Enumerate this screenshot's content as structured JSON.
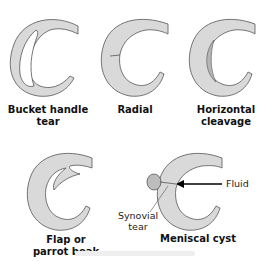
{
  "diagram": {
    "colors": {
      "fill": "#d9d9d9",
      "stroke": "#555555",
      "cyst": "#bdbdbd",
      "arrow": "#000000",
      "text": "#111111"
    },
    "panels": [
      {
        "id": "bucket-handle",
        "label_line1": "Bucket handle",
        "label_line2": "tear"
      },
      {
        "id": "radial",
        "label_line1": "Radial",
        "label_line2": ""
      },
      {
        "id": "horizontal",
        "label_line1": "Horizontal",
        "label_line2": "cleavage"
      },
      {
        "id": "flap",
        "label_line1": "Flap or",
        "label_line2": "parrot beak"
      },
      {
        "id": "meniscal-cyst",
        "label_line1": "Meniscal cyst",
        "label_line2": ""
      }
    ],
    "annotations": {
      "fluid": "Fluid",
      "synovial_line1": "Synovial",
      "synovial_line2": "tear"
    }
  }
}
